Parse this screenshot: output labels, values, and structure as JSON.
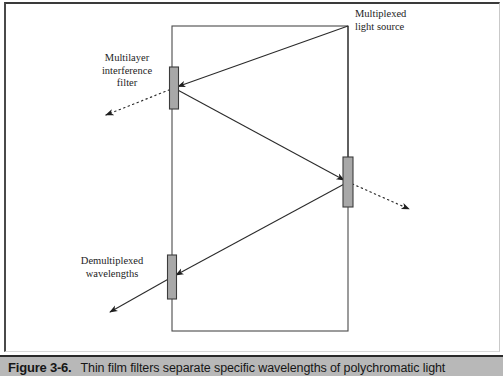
{
  "figure": {
    "caption_number": "Figure 3-6.",
    "caption_text": "Thin film filters separate specific wavelengths of polychromatic light"
  },
  "diagram": {
    "labels": {
      "multiplexed_source": "Multiplexed\nlight source",
      "multilayer_filter": "Multilayer\ninterference\nfilter",
      "demultiplexed": "Demultiplexed\nwavelengths"
    },
    "colors": {
      "line": "#2a2a2a",
      "filter_fill": "#a8a8a8",
      "filter_stroke": "#3c3c3c",
      "waveguide_stroke": "#4a4a4a",
      "caption_bar": "#b8b8b8",
      "background": "#ffffff"
    },
    "waveguide": {
      "x1": 172,
      "y1": 26,
      "x2": 348,
      "y2": 331
    },
    "filters": [
      {
        "name": "multilayer-interference-filter",
        "cx": 174,
        "cy": 88,
        "width": 9,
        "height": 42
      },
      {
        "name": "output-filter-right",
        "cx": 348,
        "cy": 182,
        "width": 10,
        "height": 50
      },
      {
        "name": "demultiplexing-filter-bottom",
        "cx": 172,
        "cy": 277,
        "width": 9,
        "height": 44
      }
    ],
    "rays": [
      {
        "name": "source-to-left-filter",
        "style": "solid",
        "x1": 348,
        "y1": 26,
        "x2": 174,
        "y2": 88
      },
      {
        "name": "left-filter-to-right-filter",
        "style": "solid",
        "x1": 174,
        "y1": 88,
        "x2": 348,
        "y2": 182
      },
      {
        "name": "source-to-right-filter",
        "style": "solid",
        "x1": 348,
        "y1": 26,
        "x2": 348,
        "y2": 182
      },
      {
        "name": "right-filter-to-bottom-filter",
        "style": "solid",
        "x1": 348,
        "y1": 182,
        "x2": 172,
        "y2": 277
      },
      {
        "name": "bottom-filter-output",
        "style": "solid",
        "x1": 172,
        "y1": 277,
        "x2": 105,
        "y2": 315
      },
      {
        "name": "left-filter-dropped-wavelength",
        "style": "dotted",
        "x1": 174,
        "y1": 88,
        "x2": 100,
        "y2": 117
      },
      {
        "name": "right-filter-dropped-wavelength",
        "style": "dotted",
        "x1": 348,
        "y1": 182,
        "x2": 415,
        "y2": 212
      }
    ]
  }
}
